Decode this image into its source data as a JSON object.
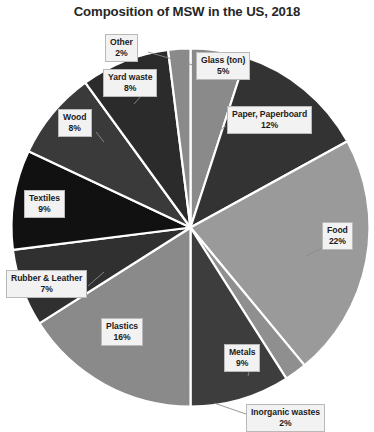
{
  "chart_data": {
    "type": "pie",
    "title": "Composition of MSW in the US, 2018",
    "xlabel": "",
    "ylabel": "",
    "units": "percent",
    "legend": "none",
    "grid": false,
    "labels_position": "callout-boxes",
    "total": 100,
    "categories": [
      "Glass (ton)",
      "Paper, Paperboard",
      "Food",
      "Inorganic wastes",
      "Metals",
      "Plastics",
      "Rubber & Leather",
      "Textiles",
      "Wood",
      "Yard waste",
      "Other"
    ],
    "values": [
      5,
      12,
      22,
      2,
      9,
      16,
      7,
      9,
      8,
      8,
      2
    ],
    "value_labels": [
      "5%",
      "12%",
      "22%",
      "2%",
      "9%",
      "16%",
      "7%",
      "9%",
      "8%",
      "8%",
      "2%"
    ],
    "colors": [
      "#8a8a8a",
      "#333333",
      "#9a9a9a",
      "#8f8f8f",
      "#3d3d3d",
      "#8a8a8a",
      "#303030",
      "#111111",
      "#3a3a3a",
      "#2b2b2b",
      "#8a8a8a"
    ],
    "slices": [
      {
        "label": "Glass (ton)",
        "value": 5,
        "value_label": "5%",
        "color": "#8a8a8a"
      },
      {
        "label": "Paper, Paperboard",
        "value": 12,
        "value_label": "12%",
        "color": "#333333"
      },
      {
        "label": "Food",
        "value": 22,
        "value_label": "22%",
        "color": "#9a9a9a"
      },
      {
        "label": "Inorganic wastes",
        "value": 2,
        "value_label": "2%",
        "color": "#8f8f8f"
      },
      {
        "label": "Metals",
        "value": 9,
        "value_label": "9%",
        "color": "#3d3d3d"
      },
      {
        "label": "Plastics",
        "value": 16,
        "value_label": "16%",
        "color": "#8a8a8a"
      },
      {
        "label": "Rubber & Leather",
        "value": 7,
        "value_label": "7%",
        "color": "#303030"
      },
      {
        "label": "Textiles",
        "value": 9,
        "value_label": "9%",
        "color": "#111111"
      },
      {
        "label": "Wood",
        "value": 8,
        "value_label": "8%",
        "color": "#3a3a3a"
      },
      {
        "label": "Yard waste",
        "value": 8,
        "value_label": "8%",
        "color": "#2b2b2b"
      },
      {
        "label": "Other",
        "value": 2,
        "value_label": "2%",
        "color": "#8a8a8a"
      }
    ]
  },
  "callouts": {
    "other": {
      "label": "Other",
      "value": "2%"
    },
    "glass": {
      "label": "Glass (ton)",
      "value": "5%"
    },
    "paper": {
      "label": "Paper, Paperboard",
      "value": "12%"
    },
    "food": {
      "label": "Food",
      "value": "22%"
    },
    "inorganic": {
      "label": "Inorganic wastes",
      "value": "2%"
    },
    "metals": {
      "label": "Metals",
      "value": "9%"
    },
    "plastics": {
      "label": "Plastics",
      "value": "16%"
    },
    "rubber": {
      "label": "Rubber & Leather",
      "value": "7%"
    },
    "textiles": {
      "label": "Textiles",
      "value": "9%"
    },
    "wood": {
      "label": "Wood",
      "value": "8%"
    },
    "yard": {
      "label": "Yard waste",
      "value": "8%"
    }
  },
  "style": {
    "background": "#ffffff",
    "title_color": "#262626",
    "callout_bg": "#f2f2f2",
    "callout_border": "#b9b9b9",
    "slice_gap_color": "#ffffff"
  }
}
